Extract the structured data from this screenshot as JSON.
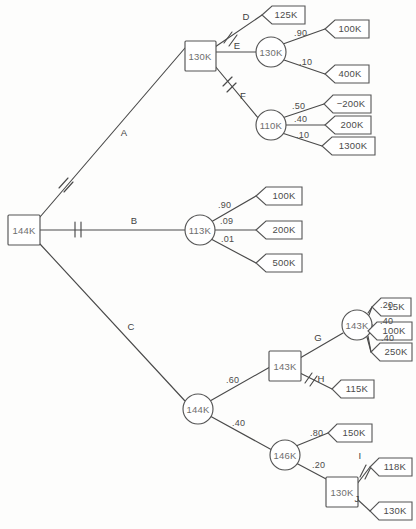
{
  "diagram": {
    "type": "decision-tree",
    "colors": {
      "line": "#4a4a4a",
      "node_stroke": "#555555",
      "text": "#4b4b4b",
      "background": "#fdfdfc"
    },
    "legend": {
      "square_meaning": "decision node",
      "circle_meaning": "chance node",
      "pentagon_meaning": "terminal payoff",
      "slash_meaning": "pruned branch"
    }
  },
  "nodes": {
    "root": {
      "id": "root",
      "shape": "square",
      "value": "144K",
      "x": 24,
      "y": 230
    },
    "n_d1": {
      "id": "n_d1",
      "shape": "square",
      "value": "130K",
      "x": 200,
      "y": 56
    },
    "n_c_130": {
      "id": "n_c_130",
      "shape": "circle",
      "value": "130K",
      "x": 271,
      "y": 52
    },
    "n_c_110": {
      "id": "n_c_110",
      "shape": "circle",
      "value": "110K",
      "x": 271,
      "y": 125
    },
    "n_c_113": {
      "id": "n_c_113",
      "shape": "circle",
      "value": "113K",
      "x": 200,
      "y": 230
    },
    "n_c_144": {
      "id": "n_c_144",
      "shape": "circle",
      "value": "144K",
      "x": 198,
      "y": 409
    },
    "n_d_143": {
      "id": "n_d_143",
      "shape": "square",
      "value": "143K",
      "x": 285,
      "y": 366
    },
    "n_c_143": {
      "id": "n_c_143",
      "shape": "circle",
      "value": "143K",
      "x": 357,
      "y": 325
    },
    "n_c_146": {
      "id": "n_c_146",
      "shape": "circle",
      "value": "146K",
      "x": 285,
      "y": 455
    },
    "n_d_130": {
      "id": "n_d_130",
      "shape": "square",
      "value": "130K",
      "x": 342,
      "y": 492
    }
  },
  "terminals": [
    {
      "id": "t_125",
      "label": "125K",
      "x": 283,
      "y": 15
    },
    {
      "id": "t_100a",
      "label": "100K",
      "x": 347,
      "y": 29
    },
    {
      "id": "t_400a",
      "label": "400K",
      "x": 347,
      "y": 74
    },
    {
      "id": "t_m200",
      "label": "−200K",
      "x": 348,
      "y": 104
    },
    {
      "id": "t_200a",
      "label": "200K",
      "x": 350,
      "y": 125
    },
    {
      "id": "t_1300",
      "label": "1300K",
      "x": 350,
      "y": 146
    },
    {
      "id": "t_100b",
      "label": "100K",
      "x": 281,
      "y": 196
    },
    {
      "id": "t_200b",
      "label": "200K",
      "x": 281,
      "y": 230
    },
    {
      "id": "t_500",
      "label": "500K",
      "x": 281,
      "y": 263
    },
    {
      "id": "t_15",
      "label": "15K",
      "x": 392,
      "y": 307
    },
    {
      "id": "t_100c",
      "label": "100K",
      "x": 389,
      "y": 331
    },
    {
      "id": "t_250",
      "label": "250K",
      "x": 389,
      "y": 352
    },
    {
      "id": "t_115",
      "label": "115K",
      "x": 352,
      "y": 388
    },
    {
      "id": "t_150",
      "label": "150K",
      "x": 350,
      "y": 433
    },
    {
      "id": "t_118",
      "label": "118K",
      "x": 389,
      "y": 467
    },
    {
      "id": "t_130",
      "label": "130K",
      "x": 389,
      "y": 511
    }
  ],
  "branch_labels": [
    {
      "id": "lbl_A",
      "text": "A",
      "x": 124,
      "y": 133
    },
    {
      "id": "lbl_B",
      "text": "B",
      "x": 134,
      "y": 221
    },
    {
      "id": "lbl_C",
      "text": "C",
      "x": 131,
      "y": 327
    },
    {
      "id": "lbl_D",
      "text": "D",
      "x": 246,
      "y": 17
    },
    {
      "id": "lbl_E",
      "text": "E",
      "x": 237,
      "y": 46
    },
    {
      "id": "lbl_F",
      "text": "F",
      "x": 243,
      "y": 96
    },
    {
      "id": "lbl_G",
      "text": "G",
      "x": 318,
      "y": 338
    },
    {
      "id": "lbl_H",
      "text": "H",
      "x": 321,
      "y": 379
    },
    {
      "id": "lbl_I",
      "text": "I",
      "x": 360,
      "y": 456
    },
    {
      "id": "lbl_J",
      "text": "J",
      "x": 357,
      "y": 499
    }
  ],
  "probabilities": [
    {
      "id": "p_130_100",
      "text": ".90",
      "x": 294,
      "y": 34
    },
    {
      "id": "p_130_400",
      "text": ".10",
      "x": 299,
      "y": 63
    },
    {
      "id": "p_110_m200",
      "text": ".50",
      "x": 292,
      "y": 107
    },
    {
      "id": "p_110_200",
      "text": ".40",
      "x": 294,
      "y": 120
    },
    {
      "id": "p_110_1300",
      "text": ".10",
      "x": 296,
      "y": 136
    },
    {
      "id": "p_113_100",
      "text": ".90",
      "x": 218,
      "y": 206
    },
    {
      "id": "p_113_200",
      "text": ".09",
      "x": 220,
      "y": 222
    },
    {
      "id": "p_113_500",
      "text": ".01",
      "x": 221,
      "y": 240
    },
    {
      "id": "p_144_143",
      "text": ".60",
      "x": 226,
      "y": 381
    },
    {
      "id": "p_144_146",
      "text": ".40",
      "x": 232,
      "y": 424
    },
    {
      "id": "p_143_15",
      "text": ".20",
      "x": 380,
      "y": 306
    },
    {
      "id": "p_143_100",
      "text": ".40",
      "x": 380,
      "y": 322
    },
    {
      "id": "p_143_250",
      "text": ".40",
      "x": 381,
      "y": 339
    },
    {
      "id": "p_146_150",
      "text": ".80",
      "x": 310,
      "y": 434
    },
    {
      "id": "p_146_130",
      "text": ".20",
      "x": 312,
      "y": 466
    }
  ],
  "edges": [
    {
      "id": "e_root_A",
      "from": "root",
      "to": "n_d1",
      "label": "A",
      "pruned": true
    },
    {
      "id": "e_root_B",
      "from": "root",
      "to": "n_c_113",
      "label": "B",
      "pruned": true
    },
    {
      "id": "e_root_C",
      "from": "root",
      "to": "n_c_144",
      "label": "C",
      "pruned": false
    },
    {
      "id": "e_d1_D",
      "from": "n_d1",
      "to": "t_125",
      "label": "D",
      "pruned": true
    },
    {
      "id": "e_d1_E",
      "from": "n_d1",
      "to": "n_c_130",
      "label": "E",
      "pruned": false
    },
    {
      "id": "e_d1_F",
      "from": "n_d1",
      "to": "n_c_110",
      "label": "F",
      "pruned": true
    },
    {
      "id": "e_143_G",
      "from": "n_d_143",
      "to": "n_c_143",
      "label": "G",
      "pruned": false
    },
    {
      "id": "e_143_H",
      "from": "n_d_143",
      "to": "t_115",
      "label": "H",
      "pruned": true
    },
    {
      "id": "e_130_I",
      "from": "n_d_130",
      "to": "t_118",
      "label": "I",
      "pruned": true
    },
    {
      "id": "e_130_J",
      "from": "n_d_130",
      "to": "t_130",
      "label": "J",
      "pruned": false
    }
  ]
}
